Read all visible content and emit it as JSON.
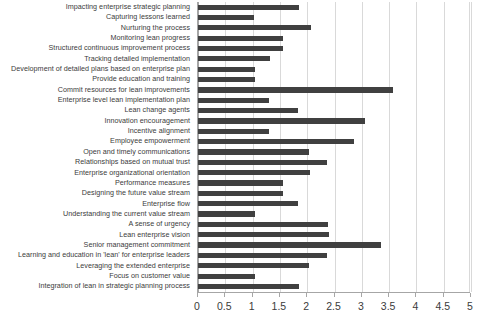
{
  "chart_data": {
    "type": "bar",
    "orientation": "horizontal",
    "title": "",
    "subtitle": "",
    "xlabel": "",
    "ylabel": "",
    "xlim": [
      0,
      5
    ],
    "xticks": [
      0,
      0.5,
      1,
      1.5,
      2,
      2.5,
      3,
      3.5,
      4,
      4.5,
      5
    ],
    "xtick_labels": [
      "0",
      "0.5",
      "1",
      "1.5",
      "2",
      "2.5",
      "3",
      "3.5",
      "4",
      "4.5",
      "5"
    ],
    "grid": true,
    "legend": null,
    "bar_color": "#404040",
    "grid_color": "#d9d9d9",
    "axis_color": "#a6a6a6",
    "categories": [
      "Impacting enterprise strategic planning",
      "Capturing lessons learned",
      "Nurturing the process",
      "Monitoring lean progress",
      "Structured continuous improvement process",
      "Tracking detailed implementation",
      "Development of detailed plans based on enterprise plan",
      "Provide education and training",
      "Commit resources for lean improvements",
      "Enterprise level lean implementation plan",
      "Lean change agents",
      "Innovation encouragement",
      "Incentive alignment",
      "Employee empowerment",
      "Open and timely communications",
      "Relationships based on mutual trust",
      "Enterprise organizational orientation",
      "Performance measures",
      "Designing the future value stream",
      "Enterprise flow",
      "Understanding the current value stream",
      "A sense of urgency",
      "Lean enterprise vision",
      "Senior management commitment",
      "Learning and education in 'lean' for enterprise leaders",
      "Leveraging the extended enterprise",
      "Focus on customer value",
      "Integration of lean in strategic planning process"
    ],
    "values": [
      1.85,
      1.03,
      2.07,
      1.56,
      1.56,
      1.32,
      1.04,
      1.04,
      3.57,
      1.3,
      1.83,
      3.06,
      1.3,
      2.86,
      2.03,
      2.36,
      2.05,
      1.56,
      1.56,
      1.83,
      1.04,
      2.38,
      2.4,
      3.35,
      2.36,
      2.03,
      1.04,
      1.85
    ]
  }
}
